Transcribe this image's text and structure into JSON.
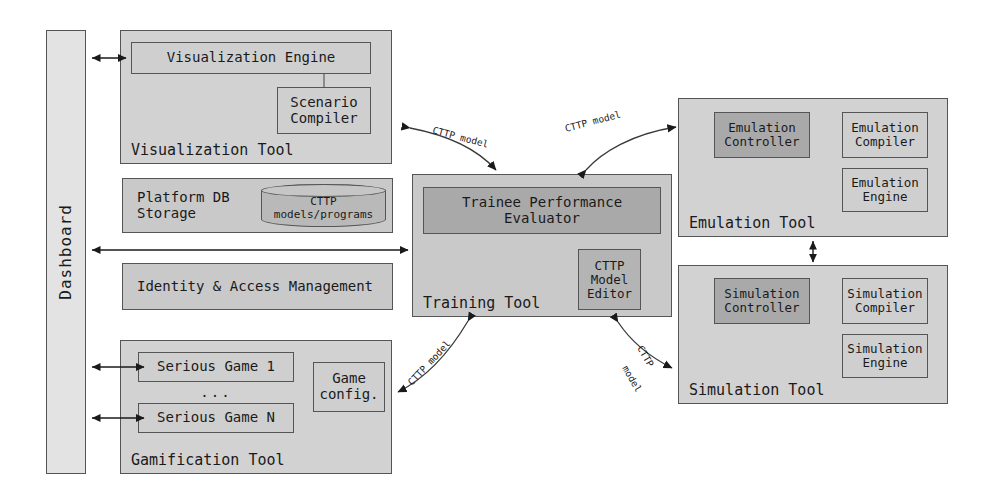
{
  "diagram": {
    "colors": {
      "tool_fill": "#d2d2d2",
      "component_fill": "#c9c9c9",
      "highlight_fill": "#a9a9a9",
      "panel_fill": "#e3e3e3",
      "db_fill": "#b9b9b9",
      "stroke": "#555555",
      "arrow": "#1a1a1a"
    }
  },
  "sidebar": {
    "label": "Dashboard"
  },
  "visualization_tool": {
    "label": "Visualization Tool",
    "engine": "Visualization Engine",
    "scenario_compiler": "Scenario\nCompiler"
  },
  "platform_db": {
    "label": "Platform DB\nStorage",
    "cylinder": "CTTP\nmodels/programs"
  },
  "iam": {
    "label": "Identity & Access Management"
  },
  "gamification_tool": {
    "label": "Gamification Tool",
    "game_first": "Serious Game 1",
    "ellipsis": "...",
    "game_last": "Serious Game N",
    "game_config": "Game\nconfig."
  },
  "training_tool": {
    "label": "Training Tool",
    "evaluator": "Trainee Performance\nEvaluator",
    "model_editor": "CTTP\nModel\nEditor"
  },
  "emulation_tool": {
    "label": "Emulation Tool",
    "controller": "Emulation\nController",
    "compiler": "Emulation\nCompiler",
    "engine": "Emulation\nEngine"
  },
  "simulation_tool": {
    "label": "Simulation Tool",
    "controller": "Simulation\nController",
    "compiler": "Simulation\nCompiler",
    "engine": "Simulation\nEngine"
  },
  "arrow_labels": {
    "viz_to_training": "CTTP model",
    "training_to_emulation": "CTTP model",
    "training_to_gamification": "CTTP model",
    "training_to_simulation_line1": "CTTP",
    "training_to_simulation_line2": "model"
  }
}
